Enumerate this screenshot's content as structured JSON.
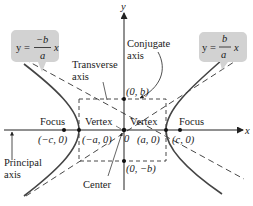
{
  "diagram": {
    "type": "hyperbola-anatomy",
    "axes": {
      "x_label": "x",
      "y_label": "y"
    },
    "center_label": "Center",
    "origin_label": "0",
    "transverse_axis_label": [
      "Transverse",
      "axis"
    ],
    "conjugate_axis_label": [
      "Conjugate",
      "axis"
    ],
    "principal_axis_label": [
      "Principal",
      "axis"
    ],
    "left_vertex": {
      "label": "Vertex",
      "coords": "(−a, 0)"
    },
    "right_vertex": {
      "label": "Vertex",
      "coords": "(a, 0)"
    },
    "left_focus": {
      "label": "Focus",
      "coords": "(−c, 0)"
    },
    "right_focus": {
      "label": "Focus",
      "coords": "(c, 0)"
    },
    "top_point": {
      "coords": "(0, b)"
    },
    "bottom_point": {
      "coords": "(0, −b)"
    },
    "left_asymptote": {
      "lhs": "y =",
      "numerator": "−b",
      "denominator": "a",
      "var": "x"
    },
    "right_asymptote": {
      "lhs": "y =",
      "numerator": "b",
      "denominator": "a",
      "var": "x"
    },
    "colors": {
      "curve": "#444444",
      "axis": "#222222",
      "callout_fill": "#d2d2d2",
      "point": "#111111"
    }
  }
}
